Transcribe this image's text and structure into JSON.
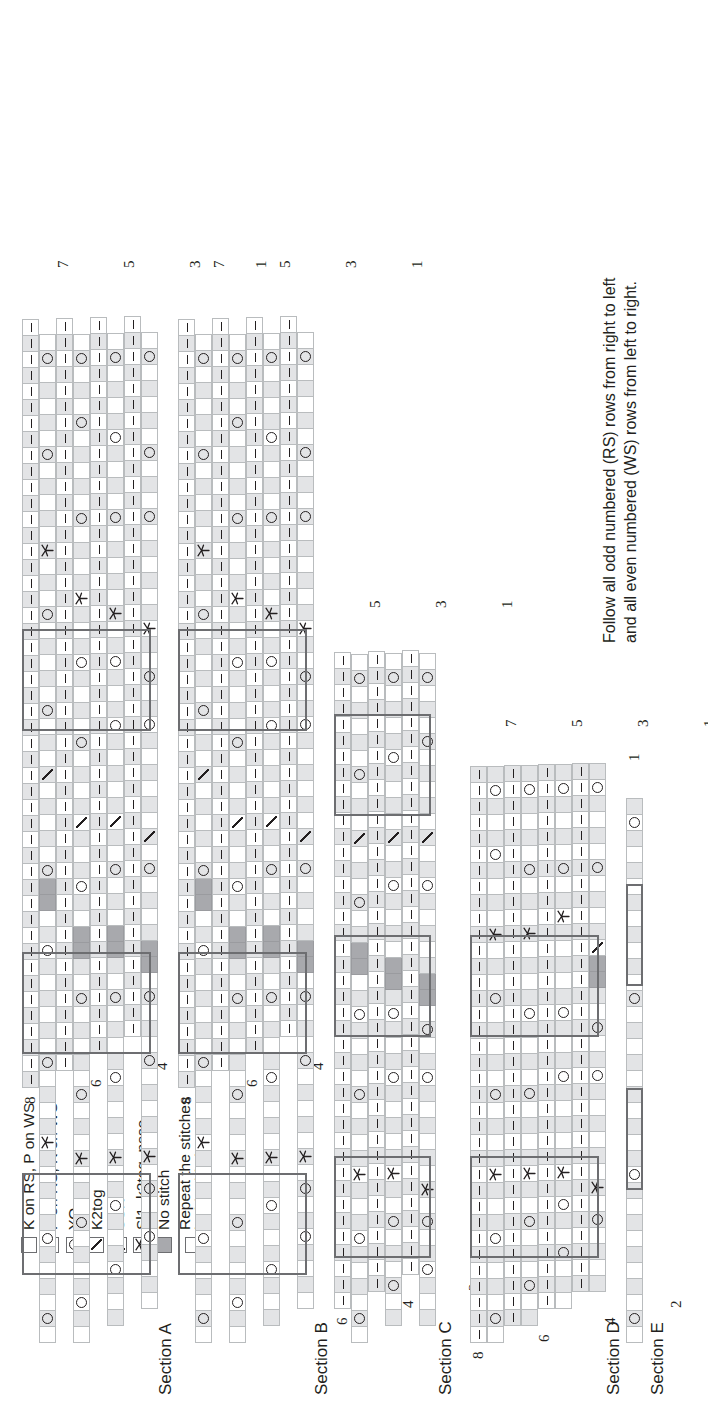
{
  "document": {
    "type": "knitting-stitch-chart",
    "orientation": "rotated-90-ccw"
  },
  "legend": {
    "title": "",
    "entries": [
      {
        "symbol": "empty-square",
        "label": "K on RS, P on WS"
      },
      {
        "symbol": "dash",
        "label": "P on RS, K on WS"
      },
      {
        "symbol": "circle",
        "label": "YO"
      },
      {
        "symbol": "slash-right",
        "label": "K2tog"
      },
      {
        "symbol": "slash-left",
        "label": "SSK"
      },
      {
        "symbol": "cdd",
        "label": "Sl1, k2tog, psso"
      },
      {
        "symbol": "filled-gray",
        "label": "No stitch"
      },
      {
        "symbol": "repeat-box",
        "label": "Repeat the stitches\ninside this box"
      }
    ],
    "colors": {
      "no_stitch": "#a8a9ad",
      "shaded_cell": "#e3e4e6",
      "grid_line": "#b9bcbe",
      "repeat_border": "#6d6e71",
      "symbol": "#231f20"
    }
  },
  "instructions": {
    "text": "Follow all odd numbered (RS) rows from right to left\nand all even numbered (WS) rows from left to right."
  },
  "sections": [
    {
      "id": "A",
      "name": "Section A",
      "row_numbers_left": [
        "8",
        "6",
        "4",
        "2"
      ],
      "row_numbers_right": [
        "7",
        "5",
        "3",
        "1"
      ],
      "rows": 8,
      "max_width": 45
    },
    {
      "id": "B",
      "name": "Section B",
      "row_numbers_left": [
        "8",
        "6",
        "4",
        "2"
      ],
      "row_numbers_right": [
        "7",
        "5",
        "3",
        "1"
      ],
      "rows": 8,
      "max_width": 45
    },
    {
      "id": "C",
      "name": "Section C",
      "row_numbers_left": [
        "6",
        "4",
        "2"
      ],
      "row_numbers_right": [
        "5",
        "3",
        "1"
      ],
      "rows": 6,
      "max_width": 41
    },
    {
      "id": "D",
      "name": "Section D",
      "row_numbers_left": [
        "8",
        "6",
        "4",
        "2"
      ],
      "row_numbers_right": [
        "7",
        "5",
        "3",
        "1"
      ],
      "rows": 8,
      "max_width": 37
    },
    {
      "id": "E",
      "name": "Section E",
      "row_numbers_left": [],
      "row_numbers_right": [
        "1"
      ],
      "rows": 1,
      "max_width": 34
    }
  ],
  "chart_data": {
    "type": "heatmap",
    "xlabel": "stitch",
    "ylabel": "row",
    "symbol_key": {
      "k": "K on RS, P on WS (empty square)",
      "p": "P on RS, K on WS (dash)",
      "o": "YO (circle)",
      "/": "K2tog",
      "\\": "SSK",
      "A": "Sl1, k2tog, psso (centered double decrease)",
      "x": "No stitch (solid gray)",
      ".": "no cell / outside chart"
    },
    "note": "Rows are listed top (highest row number) to bottom (row 1). Each string is one row, left to right as printed.",
    "sections": {
      "A": {
        "rows": [
          {
            "n": 8,
            "cells": "pppppppppppppppppppppppppppppppppppppppppppppppp"
          },
          {
            "n": 7,
            "cells": "kokkkkokkkkkAkkkkokkkkkkokkxxokkkkk/kkkokkkkkokkkAkkkkkokkkkkok"
          },
          {
            "n": 6,
            "cells": "ppppppppppppppppppppppppppppppppppppppppppppppp"
          },
          {
            "n": 5,
            "cells": "kkokkkkokkkAkkkokkkkkokkxxkkokkk/kkkkokkkkokkkAkkkkokkkkkokkkok"
          },
          {
            "n": 4,
            "cells": "pppppppppppppppppppppppppppppppppppppppppppppp"
          },
          {
            "n": 3,
            "cells": "kkkokkkokkAkkkkokkkkokkxxkkkokk/kkkkkokkkokkAkkkkkokkkkokkkkok"
          },
          {
            "n": 2,
            "cells": "ppppppppppppppppppppppppppppppppppppppppppppp"
          },
          {
            "n": 1,
            "cells": "kkkkokkokAkkkkkokkkokxxkkkkok/kkkkkkokkokkAkkkkkkokkkokkkkkok"
          }
        ]
      },
      "B": {
        "rows": [
          {
            "n": 8,
            "cells": "pppppppppppppppppppppppppppppppppppppppppppppppp"
          },
          {
            "n": 7,
            "cells": "kokkkkokkkkkAkkkkokkkkkkokkxxokkkkk/kkkokkkkkokkkAkkkkkokkkkkok"
          },
          {
            "n": 6,
            "cells": "ppppppppppppppppppppppppppppppppppppppppppppppp"
          },
          {
            "n": 5,
            "cells": "kkokkkkokkkAkkkokkkkkokkxxkkokkk/kkkkokkkkokkkAkkkkokkkkkokkkok"
          },
          {
            "n": 4,
            "cells": "pppppppppppppppppppppppppppppppppppppppppppppp"
          },
          {
            "n": 3,
            "cells": "kkkokkkokkAkkkkokkkkokkxxkkkokk/kkkkkokkkokkAkkkkkokkkkokkkkok"
          },
          {
            "n": 2,
            "cells": "ppppppppppppppppppppppppppppppppppppppppppppp"
          },
          {
            "n": 1,
            "cells": "kkkkokkokAkkkkkokkkokxxkkkkok/kkkkkkokkokkAkkkkkkokkkokkkkkok"
          }
        ]
      },
      "C": {
        "rows": [
          {
            "n": 6,
            "cells": "ppppppppppppppppppppppppppppppppppppppppp"
          },
          {
            "n": 5,
            "cells": "kokkkkokkkAkkkkokkkkokkxxkkokkk/kkkokkkkkok"
          },
          {
            "n": 4,
            "cells": "pppppppppppppppppppppppppppppppppppppppp"
          },
          {
            "n": 3,
            "cells": "kkokkkokkAkkkkkokkkokxxkkkkokk/kkkkokkkkok"
          },
          {
            "n": 2,
            "cells": "ppppppppppppppppppppppppppppppppppppppp"
          },
          {
            "n": 1,
            "cells": "kkkokkokAkkkkkkokkokxxkkkkkokk/kkkkkokkkok"
          }
        ]
      },
      "D": {
        "rows": [
          {
            "n": 8,
            "cells": "pppppppppppppppppppppppppppppppppppp"
          },
          {
            "n": 7,
            "cells": "kokkkkokkkAkkkkokkkkkokkkAkkkkokkkok"
          },
          {
            "n": 6,
            "cells": "ppppppppppppppppppppppppppppppppppp"
          },
          {
            "n": 5,
            "cells": "kkokkkokkAkkkkokkkkokkkkAkkkokkkkok"
          },
          {
            "n": 4,
            "cells": "pppppppppppppppppppppppppppppppppp"
          },
          {
            "n": 3,
            "cells": "kkkokkokAkkkkkokkkokkkkkAkkokkkkok"
          },
          {
            "n": 2,
            "cells": "ppppppppppppppppppppppppppppppppp"
          },
          {
            "n": 1,
            "cells": "kkkkokAkkkkkkokkokkxx/kkkkokkkkok"
          }
        ]
      },
      "E": {
        "rows": [
          {
            "n": 1,
            "cells": "kokkkkkkkkokkkkkkkkkkokkkkkkkkkkok"
          }
        ]
      }
    }
  }
}
